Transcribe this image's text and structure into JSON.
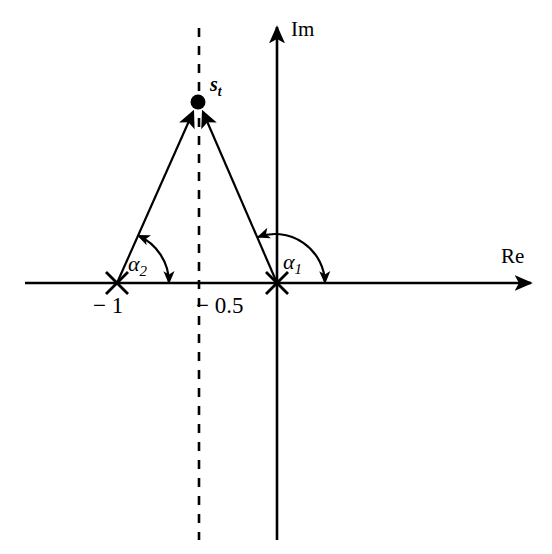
{
  "figure": {
    "type": "complex-plane-root-locus-diagram",
    "background_color": "#ffffff",
    "stroke_color": "#000000"
  },
  "axes": {
    "real": {
      "label": "Re",
      "orientation": "horizontal",
      "arrow": "right",
      "x_start": 25,
      "x_end": 537,
      "y": 283
    },
    "imaginary": {
      "label": "Im",
      "orientation": "vertical",
      "arrow": "up",
      "x": 277,
      "y_start": 22,
      "y_end": 540
    }
  },
  "ticks": [
    {
      "name": "tick-minus-one",
      "label": "− 1",
      "x": 117,
      "y": 283,
      "marker": "x-cross"
    },
    {
      "name": "tick-origin",
      "label": "",
      "x": 277,
      "y": 283,
      "marker": "x-cross"
    }
  ],
  "tick_labels": [
    {
      "name": "tick-label-minus-one",
      "text": "− 1",
      "x": 93,
      "y": 296
    },
    {
      "name": "tick-label-minus-half",
      "text": "− 0.5",
      "x": 196,
      "y": 296
    }
  ],
  "dashed_line": {
    "name": "asymptote-dashed-line",
    "x": 199,
    "y_start": 28,
    "y_end": 540,
    "dash": "9 9"
  },
  "point": {
    "name": "s_t",
    "label": "s",
    "subscript": "t",
    "x": 198,
    "y": 102,
    "radius": 7.5,
    "label_x": 210,
    "label_y": 75
  },
  "vectors": [
    {
      "name": "vector-from-minus-one",
      "from_x": 117,
      "from_y": 283,
      "to_x": 193,
      "to_y": 109,
      "arrow": "end"
    },
    {
      "name": "vector-from-origin",
      "from_x": 277,
      "from_y": 283,
      "to_x": 204,
      "to_y": 109,
      "arrow": "end"
    }
  ],
  "angles": [
    {
      "name": "angle-alpha-1",
      "label": "α",
      "subscript": "1",
      "vertex_x": 277,
      "vertex_y": 283,
      "radius": 50,
      "start_deg": 113,
      "end_deg": 0,
      "label_x": 283,
      "label_y": 252,
      "arrows": "both"
    },
    {
      "name": "angle-alpha-2",
      "label": "α",
      "subscript": "2",
      "vertex_x": 117,
      "vertex_y": 283,
      "radius": 52,
      "start_deg": 66,
      "end_deg": 0,
      "label_x": 128,
      "label_y": 254,
      "arrows": "both"
    }
  ],
  "axis_labels": [
    {
      "name": "im-axis-label",
      "text": "Im",
      "x": 291,
      "y": 19
    },
    {
      "name": "re-axis-label",
      "text": "Re",
      "x": 501,
      "y": 246
    }
  ]
}
